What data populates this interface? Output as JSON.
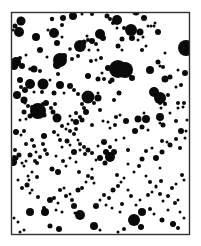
{
  "canvas": {
    "width": 201,
    "height": 246,
    "background": "#ffffff"
  },
  "frame": {
    "x": 11.5,
    "y": 12.5,
    "width": 178,
    "height": 222,
    "stroke": "#333333",
    "stroke_width": 1.4
  },
  "dot_color": "#0a0a0a",
  "dots": [
    [
      21,
      21,
      4.5
    ],
    [
      15,
      26,
      2.5
    ],
    [
      19,
      32,
      5
    ],
    [
      13,
      30,
      1.5
    ],
    [
      36,
      37,
      4
    ],
    [
      26,
      55,
      1.5
    ],
    [
      20,
      58,
      2
    ],
    [
      16,
      62,
      5
    ],
    [
      14,
      66,
      4
    ],
    [
      22,
      66,
      3
    ],
    [
      30,
      69,
      1.8
    ],
    [
      34,
      69,
      3.5
    ],
    [
      40,
      71,
      2
    ],
    [
      47,
      57,
      1.5
    ],
    [
      40,
      50,
      3
    ],
    [
      48,
      30,
      1.5
    ],
    [
      52,
      19,
      2.2
    ],
    [
      54,
      33,
      5
    ],
    [
      62,
      25,
      2
    ],
    [
      62,
      37,
      1.5
    ],
    [
      57,
      43,
      3
    ],
    [
      60,
      60,
      1.5
    ],
    [
      63,
      18,
      3
    ],
    [
      73,
      16,
      4
    ],
    [
      82,
      14,
      1.5
    ],
    [
      70,
      49,
      1.8
    ],
    [
      72,
      59,
      2
    ],
    [
      78,
      56,
      2
    ],
    [
      80,
      46,
      6
    ],
    [
      84,
      42,
      2.5
    ],
    [
      87,
      36,
      1.5
    ],
    [
      88,
      40,
      2
    ],
    [
      92,
      41,
      3
    ],
    [
      96,
      44,
      2
    ],
    [
      91,
      61,
      2
    ],
    [
      98,
      50,
      1.5
    ],
    [
      92,
      14,
      2
    ],
    [
      89,
      50,
      1.5
    ],
    [
      100,
      34,
      5
    ],
    [
      103,
      38,
      3
    ],
    [
      110,
      19,
      2
    ],
    [
      113,
      23,
      2
    ],
    [
      117,
      20,
      5
    ],
    [
      117,
      28,
      1.5
    ],
    [
      122,
      39,
      2.5
    ],
    [
      124,
      28,
      2
    ],
    [
      118,
      69,
      9
    ],
    [
      108,
      68,
      3
    ],
    [
      102,
      73,
      1.5
    ],
    [
      110,
      82,
      2
    ],
    [
      107,
      16,
      2.5
    ],
    [
      128,
      74,
      2
    ],
    [
      136,
      12,
      3.5
    ],
    [
      144,
      18,
      3
    ],
    [
      148,
      26,
      1.5
    ],
    [
      151,
      26,
      1.5
    ],
    [
      154,
      26,
      1.5
    ],
    [
      158,
      32,
      3
    ],
    [
      131,
      30,
      6
    ],
    [
      140,
      32,
      3.5
    ],
    [
      143,
      37,
      1.5
    ],
    [
      158,
      62,
      2.5
    ],
    [
      160,
      66,
      1.5
    ],
    [
      163,
      67,
      2
    ],
    [
      165,
      53,
      1.5
    ],
    [
      186,
      48,
      8
    ],
    [
      155,
      23,
      1.5
    ],
    [
      150,
      70,
      4
    ],
    [
      165,
      79,
      3.5
    ],
    [
      170,
      77,
      2.5
    ],
    [
      154,
      92,
      5
    ],
    [
      168,
      95,
      2
    ],
    [
      160,
      103,
      2
    ],
    [
      165,
      103,
      1.5
    ],
    [
      178,
      103,
      2
    ],
    [
      184,
      103,
      2
    ],
    [
      170,
      113,
      1.5
    ],
    [
      183,
      107,
      1.5
    ],
    [
      176,
      121,
      2
    ],
    [
      187,
      120,
      1.5
    ],
    [
      178,
      108,
      1.5
    ],
    [
      17,
      95,
      4
    ],
    [
      24,
      100,
      3.5
    ],
    [
      24,
      112,
      2.5
    ],
    [
      26,
      119,
      1.5
    ],
    [
      20,
      120,
      1.5
    ],
    [
      32,
      107,
      2
    ],
    [
      37,
      107,
      1.5
    ],
    [
      42,
      92,
      2
    ],
    [
      34,
      92,
      1.5
    ],
    [
      44,
      115,
      2.5
    ],
    [
      54,
      93,
      2.5
    ],
    [
      55,
      104,
      2
    ],
    [
      30,
      84,
      5
    ],
    [
      25,
      90,
      3
    ],
    [
      42,
      84,
      3
    ],
    [
      50,
      80,
      1.5
    ],
    [
      58,
      74,
      2
    ],
    [
      60,
      85,
      4
    ],
    [
      64,
      93,
      1.5
    ],
    [
      70,
      86,
      3
    ],
    [
      74,
      90,
      2
    ],
    [
      78,
      94,
      2
    ],
    [
      88,
      76,
      3
    ],
    [
      98,
      79,
      2.5
    ],
    [
      104,
      79,
      2
    ],
    [
      88,
      97,
      6.5
    ],
    [
      94,
      103,
      2
    ],
    [
      84,
      108,
      2
    ],
    [
      76,
      113,
      2
    ],
    [
      86,
      112,
      3
    ],
    [
      82,
      120,
      2.5
    ],
    [
      76,
      122,
      3
    ],
    [
      72,
      120,
      1.5
    ],
    [
      100,
      110,
      2
    ],
    [
      92,
      125,
      2
    ],
    [
      76,
      129,
      2
    ],
    [
      62,
      126,
      2
    ],
    [
      68,
      124,
      1.5
    ],
    [
      70,
      116,
      1.5
    ],
    [
      80,
      117,
      2
    ],
    [
      82,
      104,
      2
    ],
    [
      98,
      93,
      1.5
    ],
    [
      114,
      100,
      2
    ],
    [
      119,
      93,
      2.5
    ],
    [
      103,
      121,
      1.5
    ],
    [
      108,
      122,
      1.5
    ],
    [
      110,
      128,
      1.5
    ],
    [
      115,
      125,
      2
    ],
    [
      116,
      117,
      2
    ],
    [
      120,
      115,
      1.5
    ],
    [
      126,
      121,
      3
    ],
    [
      135,
      131,
      3
    ],
    [
      142,
      127,
      2.5
    ],
    [
      148,
      130,
      1.5
    ],
    [
      160,
      123,
      1.5
    ],
    [
      163,
      125,
      2.5
    ],
    [
      160,
      117,
      4
    ],
    [
      161,
      108,
      1.5
    ],
    [
      138,
      119,
      3.5
    ],
    [
      146,
      119,
      4
    ],
    [
      144,
      113,
      1.5
    ],
    [
      162,
      141,
      2
    ],
    [
      167,
      142,
      1.5
    ],
    [
      170,
      145,
      2.5
    ],
    [
      181,
      131,
      3
    ],
    [
      186,
      131,
      1.5
    ],
    [
      185,
      138,
      1.5
    ],
    [
      16,
      132,
      3
    ],
    [
      15,
      150,
      2
    ],
    [
      14,
      157,
      2
    ],
    [
      13,
      162,
      4
    ],
    [
      16,
      158,
      2.5
    ],
    [
      19,
      155,
      2.5
    ],
    [
      26,
      144,
      2
    ],
    [
      32,
      140,
      2
    ],
    [
      34,
      146,
      2
    ],
    [
      36,
      152,
      1.5
    ],
    [
      30,
      155,
      2.5
    ],
    [
      26,
      161,
      1.5
    ],
    [
      22,
      163,
      1.5
    ],
    [
      24,
      166,
      1.5
    ],
    [
      35,
      161,
      2
    ],
    [
      37,
      163,
      2
    ],
    [
      44,
      136,
      3
    ],
    [
      43,
      144,
      2
    ],
    [
      45,
      150,
      2
    ],
    [
      40,
      157,
      2
    ],
    [
      32,
      172,
      1.5
    ],
    [
      28,
      176,
      1.5
    ],
    [
      29,
      180,
      1.5
    ],
    [
      37,
      177,
      2
    ],
    [
      47,
      154,
      2
    ],
    [
      52,
      169,
      2.5
    ],
    [
      58,
      172,
      3
    ],
    [
      56,
      156,
      1.5
    ],
    [
      60,
      140,
      2
    ],
    [
      62,
      147,
      1.5
    ],
    [
      66,
      129,
      1.5
    ],
    [
      70,
      131,
      2
    ],
    [
      74,
      134,
      2
    ],
    [
      78,
      140,
      1.5
    ],
    [
      80,
      144,
      2
    ],
    [
      84,
      147,
      2
    ],
    [
      88,
      150,
      2.5
    ],
    [
      92,
      153,
      2
    ],
    [
      54,
      132,
      2
    ],
    [
      58,
      135,
      1.5
    ],
    [
      67,
      141,
      2.5
    ],
    [
      70,
      145,
      1.5
    ],
    [
      74,
      152,
      3
    ],
    [
      80,
      150,
      1.5
    ],
    [
      85,
      154,
      2
    ],
    [
      70,
      158,
      1.5
    ],
    [
      76,
      162,
      1.5
    ],
    [
      79,
      172,
      2
    ],
    [
      92,
      169,
      1.5
    ],
    [
      96,
      160,
      1.5
    ],
    [
      100,
      158,
      3
    ],
    [
      106,
      152,
      3
    ],
    [
      110,
      147,
      2
    ],
    [
      116,
      140,
      1.5
    ],
    [
      124,
      138,
      1.5
    ],
    [
      128,
      150,
      2
    ],
    [
      128,
      164,
      1.5
    ],
    [
      134,
      172,
      1.5
    ],
    [
      139,
      166,
      2
    ],
    [
      142,
      159,
      2.5
    ],
    [
      146,
      151,
      2
    ],
    [
      152,
      148,
      1.5
    ],
    [
      156,
      158,
      3
    ],
    [
      162,
      152,
      2.5
    ],
    [
      170,
      145,
      2
    ],
    [
      176,
      139,
      2
    ],
    [
      180,
      148,
      2
    ],
    [
      160,
      168,
      1.5
    ],
    [
      146,
      176,
      1.5
    ],
    [
      150,
      182,
      2
    ],
    [
      156,
      186,
      1.5
    ],
    [
      161,
      181,
      2
    ],
    [
      18,
      180,
      1.5
    ],
    [
      22,
      188,
      2
    ],
    [
      30,
      193,
      1.5
    ],
    [
      38,
      197,
      2
    ],
    [
      44,
      208,
      2
    ],
    [
      45,
      212,
      4
    ],
    [
      54,
      198,
      2
    ],
    [
      58,
      203,
      1.5
    ],
    [
      56,
      210,
      1.5
    ],
    [
      62,
      212,
      1.5
    ],
    [
      66,
      196,
      2
    ],
    [
      70,
      194,
      1.5
    ],
    [
      72,
      200,
      2
    ],
    [
      74,
      206,
      3
    ],
    [
      75,
      213,
      1.5
    ],
    [
      78,
      190,
      2.5
    ],
    [
      82,
      188,
      2
    ],
    [
      86,
      182,
      1.5
    ],
    [
      88,
      176,
      2
    ],
    [
      92,
      178,
      2
    ],
    [
      94,
      183,
      1.5
    ],
    [
      50,
      200,
      3
    ],
    [
      60,
      190,
      2
    ],
    [
      64,
      188,
      1.5
    ],
    [
      96,
      206,
      3
    ],
    [
      100,
      200,
      1.5
    ],
    [
      104,
      195,
      2
    ],
    [
      109,
      198,
      2
    ],
    [
      106,
      205,
      1.5
    ],
    [
      113,
      190,
      2.5
    ],
    [
      118,
      186,
      2
    ],
    [
      121,
      182,
      1.5
    ],
    [
      124,
      178,
      1.5
    ],
    [
      128,
      190,
      1.5
    ],
    [
      112,
      208,
      1.5
    ],
    [
      120,
      212,
      1.5
    ],
    [
      122,
      204,
      2
    ],
    [
      131,
      196,
      2
    ],
    [
      136,
      205,
      1.5
    ],
    [
      140,
      200,
      1.5
    ],
    [
      148,
      195,
      2
    ],
    [
      152,
      192,
      1.5
    ],
    [
      156,
      187,
      1.5
    ],
    [
      160,
      194,
      2
    ],
    [
      163,
      201,
      1.5
    ],
    [
      168,
      196,
      2
    ],
    [
      172,
      188,
      2
    ],
    [
      176,
      184,
      1.5
    ],
    [
      182,
      175,
      2
    ],
    [
      184,
      180,
      1.5
    ],
    [
      175,
      203,
      2
    ],
    [
      178,
      200,
      1.5
    ],
    [
      180,
      212,
      1.5
    ],
    [
      184,
      218,
      1.5
    ],
    [
      38,
      111,
      8
    ],
    [
      43,
      104,
      2
    ],
    [
      30,
      116,
      2.5
    ],
    [
      14,
      218,
      1.5
    ],
    [
      18,
      222,
      1.5
    ],
    [
      43,
      84,
      5.5
    ],
    [
      28,
      106,
      2
    ],
    [
      25,
      103,
      1.5
    ],
    [
      60,
      60,
      7
    ],
    [
      57,
      65,
      4
    ],
    [
      64,
      56,
      3
    ],
    [
      125,
      70,
      8
    ],
    [
      132,
      78,
      3
    ],
    [
      112,
      80,
      2.5
    ],
    [
      20,
      80,
      3
    ],
    [
      21,
      87,
      2
    ],
    [
      46,
      103,
      3
    ],
    [
      51,
      108,
      2
    ],
    [
      98,
      98,
      3.5
    ],
    [
      110,
      157,
      5
    ],
    [
      114,
      152,
      3
    ],
    [
      105,
      163,
      2.5
    ],
    [
      117,
      175,
      2
    ],
    [
      162,
      220,
      2.5
    ],
    [
      168,
      210,
      1.5
    ],
    [
      134,
      220,
      6
    ],
    [
      141,
      227,
      3
    ],
    [
      94,
      226,
      4
    ],
    [
      100,
      230,
      1.5
    ],
    [
      50,
      226,
      2.5
    ],
    [
      59,
      229,
      3
    ],
    [
      30,
      212,
      4
    ],
    [
      80,
      215,
      5
    ],
    [
      142,
      212,
      4
    ],
    [
      150,
      209,
      2
    ],
    [
      154,
      214,
      1.5
    ],
    [
      173,
      224,
      3
    ],
    [
      178,
      228,
      2
    ],
    [
      20,
      232,
      1.5
    ],
    [
      24,
      230,
      1.5
    ],
    [
      118,
      232,
      1.5
    ],
    [
      124,
      229,
      2
    ],
    [
      160,
      98,
      6
    ],
    [
      165,
      104,
      2
    ],
    [
      181,
      85,
      2
    ],
    [
      176,
      87,
      1.5
    ],
    [
      185,
      73,
      3
    ],
    [
      178,
      70,
      1.5
    ],
    [
      132,
      38,
      3
    ],
    [
      138,
      40,
      1.5
    ],
    [
      142,
      50,
      2
    ],
    [
      146,
      46,
      1.5
    ],
    [
      118,
      46,
      2.5
    ],
    [
      122,
      50,
      1.5
    ],
    [
      101,
      58,
      2
    ],
    [
      96,
      60,
      1.5
    ],
    [
      27,
      185,
      2.5
    ],
    [
      32,
      190,
      1.5
    ],
    [
      104,
      142,
      3
    ],
    [
      98,
      146,
      1.5
    ],
    [
      63,
      161,
      2
    ],
    [
      66,
      166,
      1.5
    ],
    [
      24,
      131,
      2
    ],
    [
      21,
      135,
      1.5
    ],
    [
      57,
      118,
      4.5
    ],
    [
      53,
      112,
      2.5
    ]
  ]
}
